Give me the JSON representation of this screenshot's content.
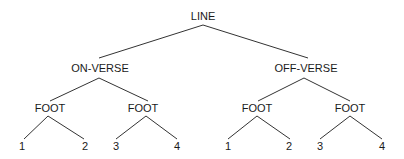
{
  "diagram": {
    "type": "tree",
    "root": {
      "label": "LINE",
      "children": [
        {
          "label": "ON-VERSE",
          "children": [
            {
              "label": "FOOT",
              "children": [
                {
                  "label": "1"
                },
                {
                  "label": "2"
                }
              ]
            },
            {
              "label": "FOOT",
              "children": [
                {
                  "label": "3"
                },
                {
                  "label": "4"
                }
              ]
            }
          ]
        },
        {
          "label": "OFF-VERSE",
          "children": [
            {
              "label": "FOOT",
              "children": [
                {
                  "label": "1"
                },
                {
                  "label": "2"
                }
              ]
            },
            {
              "label": "FOOT",
              "children": [
                {
                  "label": "3"
                },
                {
                  "label": "4"
                }
              ]
            }
          ]
        }
      ]
    }
  },
  "labels": {
    "root": "LINE",
    "on_verse": "ON-VERSE",
    "off_verse": "OFF-VERSE",
    "on_foot_1": "FOOT",
    "on_foot_2": "FOOT",
    "off_foot_1": "FOOT",
    "off_foot_2": "FOOT",
    "on_f1_leaf_1": "1",
    "on_f1_leaf_2": "2",
    "on_f2_leaf_3": "3",
    "on_f2_leaf_4": "4",
    "off_f1_leaf_1": "1",
    "off_f1_leaf_2": "2",
    "off_f2_leaf_3": "3",
    "off_f2_leaf_4": "4"
  }
}
